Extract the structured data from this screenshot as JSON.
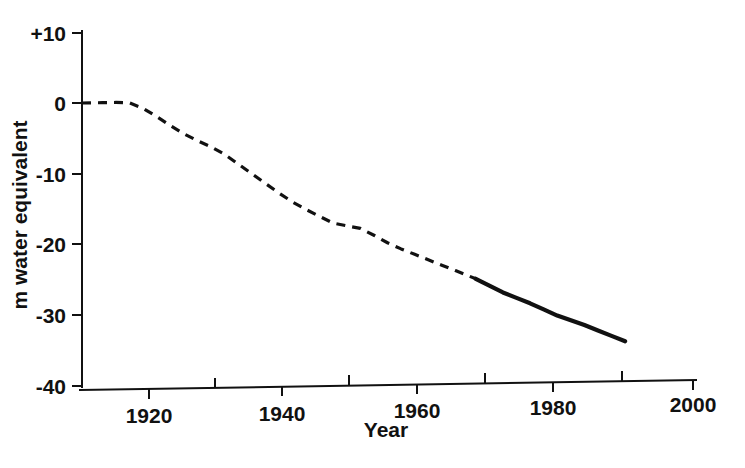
{
  "chart_data": {
    "type": "line",
    "title": "",
    "subtitle": "",
    "xlabel": "Year",
    "ylabel": "m water equivalent",
    "xlim": [
      1910,
      2000
    ],
    "ylim": [
      -40,
      10
    ],
    "grid": false,
    "legend": null,
    "x_ticks_major": [
      "1920",
      "1940",
      "1960",
      "1980",
      "2000"
    ],
    "x_ticks_major_values": [
      1920,
      1940,
      1960,
      1980,
      2000
    ],
    "x_ticks_minor_values": [
      1930,
      1950,
      1970,
      1990
    ],
    "y_ticks": [
      "+10",
      "0",
      "-10",
      "-20",
      "-30",
      "-40"
    ],
    "y_ticks_values": [
      10,
      0,
      -10,
      -20,
      -30,
      -40
    ],
    "series": [
      {
        "name": "cumulative-mass-balance-reconstructed",
        "style": "dashed",
        "x": [
          1910,
          1913,
          1915,
          1917,
          1919,
          1921,
          1923,
          1925,
          1927,
          1929,
          1931,
          1933,
          1935,
          1937,
          1939,
          1941,
          1943,
          1945,
          1947,
          1949,
          1951,
          1953,
          1955,
          1957,
          1959,
          1961,
          1963,
          1965,
          1967,
          1968
        ],
        "values": [
          0.0,
          0.0,
          0.0,
          -0.1,
          -0.9,
          -2.1,
          -3.4,
          -4.6,
          -5.6,
          -6.5,
          -7.6,
          -9.0,
          -10.4,
          -11.8,
          -13.2,
          -14.5,
          -15.6,
          -16.6,
          -17.6,
          -18.0,
          -18.4,
          -19.4,
          -20.5,
          -21.4,
          -22.2,
          -23.0,
          -23.8,
          -24.6,
          -25.4,
          -25.8
        ]
      },
      {
        "name": "cumulative-mass-balance-measured",
        "style": "solid",
        "x": [
          1968,
          1970,
          1972,
          1974,
          1976,
          1978,
          1980,
          1982,
          1984,
          1986,
          1988,
          1990
        ],
        "values": [
          -25.8,
          -26.8,
          -27.8,
          -28.6,
          -29.4,
          -30.3,
          -31.2,
          -31.9,
          -32.6,
          -33.4,
          -34.2,
          -35.0
        ]
      }
    ]
  },
  "axes": {
    "y_axis_name": "y-axis",
    "x_axis_name": "x-axis"
  }
}
